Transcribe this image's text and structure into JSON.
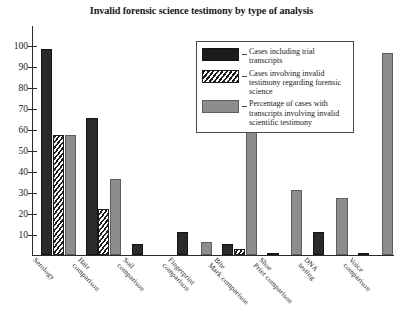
{
  "chart_data": {
    "type": "bar",
    "title": "Invalid forensic science testimony by type of analysis",
    "xlabel": "",
    "ylabel": "",
    "ylim": [
      0,
      105
    ],
    "grid": false,
    "legend_position": "upper-center-right",
    "categories": [
      "Serology",
      "Hair comparison",
      "Soil comparison",
      "Fingerprint comparison",
      "Bite Mark comparison",
      "Shoe Print comparison",
      "DNA testing",
      "Voice comparison"
    ],
    "ytick_labels": [
      "10",
      "20",
      "30",
      "40",
      "50",
      "60",
      "70",
      "80",
      "90",
      "100"
    ],
    "yticks": [
      10,
      20,
      30,
      40,
      50,
      60,
      70,
      80,
      90,
      100
    ],
    "series": [
      {
        "name": "Cases including trial transcripts",
        "key": "s0",
        "color": "#2a2a2a",
        "values": [
          98,
          65,
          5,
          11,
          5,
          1,
          11,
          1
        ]
      },
      {
        "name": "Cases involving invalid testimony regarding forensic science",
        "key": "s1",
        "color": "#1c1c1c",
        "values": [
          57,
          22,
          0,
          0,
          3,
          0,
          0,
          0
        ]
      },
      {
        "name": "Percentage of cases with transcripts involving invalid scientific testimony",
        "key": "s2",
        "color": "#8d8d8d",
        "values": [
          57,
          36,
          0,
          6,
          66,
          31,
          27,
          96
        ]
      }
    ]
  },
  "legend": {
    "items": [
      {
        "label": "Cases including trial transcripts",
        "swatch": "s0"
      },
      {
        "label": "Cases involving invalid testimony regarding forensic science",
        "swatch": "s1"
      },
      {
        "label": "Percentage of cases with transcripts involving invalid scientific testimony",
        "swatch": "s2"
      }
    ]
  }
}
